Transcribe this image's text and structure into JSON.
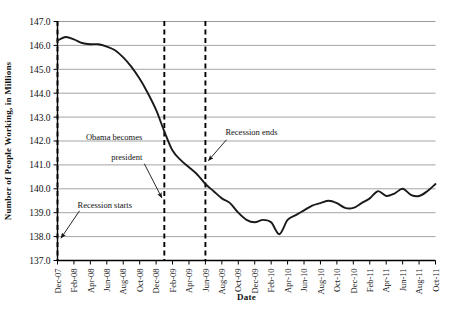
{
  "chart_data": {
    "type": "line",
    "title": "",
    "xlabel": "Date",
    "ylabel": "Number of People Working, in Millions",
    "ylim": [
      137.0,
      147.0
    ],
    "ytick_labels": [
      "137.0",
      "138.0",
      "139.0",
      "140.0",
      "141.0",
      "142.0",
      "143.0",
      "144.0",
      "145.0",
      "146.0",
      "147.0"
    ],
    "ytick_values": [
      137.0,
      138.0,
      139.0,
      140.0,
      141.0,
      142.0,
      143.0,
      144.0,
      145.0,
      146.0,
      147.0
    ],
    "grid": true,
    "legend": "none",
    "xtick_labels": [
      "Dec-07",
      "Feb-08",
      "Apr-08",
      "Jun-08",
      "Aug-08",
      "Oct-08",
      "Dec-08",
      "Feb-09",
      "Apr-09",
      "Jun-09",
      "Aug-09",
      "Oct-09",
      "Dec-09",
      "Feb-10",
      "Apr-10",
      "Jun-10",
      "Aug-10",
      "Oct-10",
      "Dec-10",
      "Feb-11",
      "Apr-11",
      "Jun-11",
      "Aug-11",
      "Oct-11"
    ],
    "x": [
      "Dec-07",
      "Jan-08",
      "Feb-08",
      "Mar-08",
      "Apr-08",
      "May-08",
      "Jun-08",
      "Jul-08",
      "Aug-08",
      "Sep-08",
      "Oct-08",
      "Nov-08",
      "Dec-08",
      "Jan-09",
      "Feb-09",
      "Mar-09",
      "Apr-09",
      "May-09",
      "Jun-09",
      "Jul-09",
      "Aug-09",
      "Sep-09",
      "Oct-09",
      "Nov-09",
      "Dec-09",
      "Jan-10",
      "Feb-10",
      "Mar-10",
      "Apr-10",
      "May-10",
      "Jun-10",
      "Jul-10",
      "Aug-10",
      "Sep-10",
      "Oct-10",
      "Nov-10",
      "Dec-10",
      "Jan-11",
      "Feb-11",
      "Mar-11",
      "Apr-11",
      "May-11",
      "Jun-11",
      "Jul-11",
      "Aug-11",
      "Sep-11",
      "Oct-11"
    ],
    "values": [
      146.2,
      146.35,
      146.25,
      146.1,
      146.05,
      146.05,
      145.95,
      145.8,
      145.5,
      145.1,
      144.6,
      144.0,
      143.3,
      142.4,
      141.6,
      141.2,
      140.9,
      140.6,
      140.2,
      139.9,
      139.6,
      139.4,
      139.0,
      138.7,
      138.6,
      138.7,
      138.6,
      138.1,
      138.7,
      138.9,
      139.1,
      139.3,
      139.4,
      139.5,
      139.4,
      139.2,
      139.2,
      139.4,
      139.6,
      139.9,
      139.7,
      139.8,
      140.0,
      139.75,
      139.7,
      139.9,
      140.2
    ],
    "annotations": [
      {
        "name": "recession-starts",
        "text": "Recession starts",
        "points_to": "Dec-07"
      },
      {
        "name": "obama-becomes-president",
        "text": "Obama becomes\npresident",
        "line1": "Obama becomes",
        "line2": "president",
        "points_to": "Jan-09"
      },
      {
        "name": "recession-ends",
        "text": "Recession ends",
        "points_to": "Jun-09"
      }
    ],
    "vertical_markers": [
      {
        "name": "recession-start-line",
        "x": "Dec-07",
        "style": "dashed"
      },
      {
        "name": "obama-inauguration-line",
        "x": "Jan-09",
        "style": "dashed"
      },
      {
        "name": "recession-end-line",
        "x": "Jun-09",
        "style": "dashed"
      }
    ],
    "colors": {
      "line": "#1a1a1a",
      "grid": "#9a9a9a",
      "axis": "#000000",
      "marker": "#000000",
      "background": "#ffffff"
    }
  }
}
